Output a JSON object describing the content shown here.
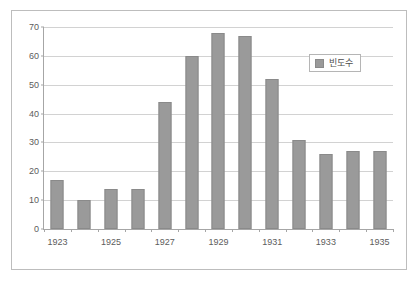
{
  "chart_data": {
    "type": "bar",
    "title": "",
    "xlabel": "",
    "ylabel": "",
    "categories": [
      "1923",
      "1924",
      "1925",
      "1926",
      "1927",
      "1928",
      "1929",
      "1930",
      "1931",
      "1932",
      "1933",
      "1934",
      "1935"
    ],
    "x_tick_labels": [
      "1923",
      "",
      "1925",
      "",
      "1927",
      "",
      "1929",
      "",
      "1931",
      "",
      "1933",
      "",
      "1935"
    ],
    "values": [
      17,
      10,
      14,
      14,
      44,
      60,
      68,
      67,
      52,
      31,
      26,
      27,
      27
    ],
    "series": [
      {
        "name": "빈도수",
        "values": [
          17,
          10,
          14,
          14,
          44,
          60,
          68,
          67,
          52,
          31,
          26,
          27,
          27
        ]
      }
    ],
    "ylim": [
      0,
      70
    ],
    "y_ticks": [
      0,
      10,
      20,
      30,
      40,
      50,
      60,
      70
    ],
    "y_tick_labels": [
      "0",
      "10",
      "20",
      "30",
      "40",
      "50",
      "60",
      "70"
    ],
    "grid": true,
    "legend_position": "upper right",
    "colors": {
      "bar_fill": "#9a9a9a",
      "bar_border": "#8a8a8a",
      "gridline": "#d2d2d2",
      "axis": "#a6a6a6",
      "frame_border": "#bdbdbd",
      "plot_background": "#ffffff",
      "text": "#5c5c5c"
    }
  },
  "legend": {
    "label": "빈도수"
  }
}
